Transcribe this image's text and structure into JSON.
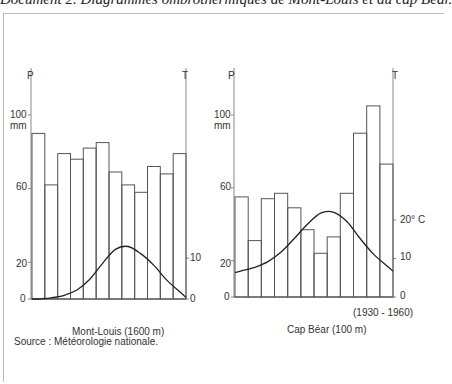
{
  "document": {
    "title": "Document 2. Diagrammes ombrothermiques de Mont-Louis et du cap Béar.",
    "period": "(1930 - 1960)",
    "source": "Source : Météorologie nationale."
  },
  "axes": {
    "p_label": "P",
    "t_label": "T",
    "mm_label": "mm",
    "p_ticks": [
      "0",
      "20",
      "60",
      "100"
    ],
    "t_ticks_mont_louis": [
      "0",
      "10"
    ],
    "t_ticks_cap_bear": [
      "0",
      "10",
      "20° C"
    ]
  },
  "colors": {
    "bars": "#555555",
    "curve": "#222222",
    "axis": "#888888"
  },
  "chart_data": [
    {
      "type": "bar+line",
      "title": "Mont-Louis (1600 m)",
      "categories": [
        "J",
        "F",
        "M",
        "A",
        "M",
        "J",
        "J",
        "A",
        "S",
        "O",
        "N",
        "D"
      ],
      "series": [
        {
          "name": "Précipitations P (mm)",
          "type": "bar",
          "values": [
            90,
            62,
            79,
            76,
            82,
            85,
            69,
            62,
            58,
            72,
            68,
            79
          ]
        },
        {
          "name": "Température T (°C)",
          "type": "line",
          "values": [
            0,
            0.3,
            0.9,
            2.2,
            4.8,
            8.7,
            12.1,
            12.8,
            11,
            8.2,
            4.6,
            1.8
          ]
        }
      ],
      "ylabel_left": "P mm",
      "ylabel_right": "T",
      "yticks_left": [
        0,
        20,
        60,
        100
      ],
      "yticks_right": [
        0,
        10
      ],
      "ylim_left": [
        0,
        105
      ],
      "scale": "P = 2T"
    },
    {
      "type": "bar+line",
      "title": "Cap Béar (100 m)",
      "categories": [
        "J",
        "F",
        "M",
        "A",
        "M",
        "J",
        "J",
        "A",
        "S",
        "O",
        "N",
        "D"
      ],
      "series": [
        {
          "name": "Précipitations P (mm)",
          "type": "bar",
          "values": [
            55,
            31,
            54,
            57,
            49,
            37,
            24,
            33,
            57,
            90,
            105,
            73
          ]
        },
        {
          "name": "Température T (°C)",
          "type": "line",
          "values": [
            6.8,
            7.7,
            9.2,
            11.7,
            15.2,
            18.9,
            21.8,
            22,
            19.6,
            15.2,
            11.2,
            8.2
          ]
        }
      ],
      "ylabel_left": "P mm",
      "ylabel_right": "T",
      "yticks_left": [
        0,
        20,
        60,
        100
      ],
      "yticks_right": [
        0,
        10,
        20
      ],
      "ylim_left": [
        0,
        105
      ],
      "scale": "P = 2T"
    }
  ]
}
